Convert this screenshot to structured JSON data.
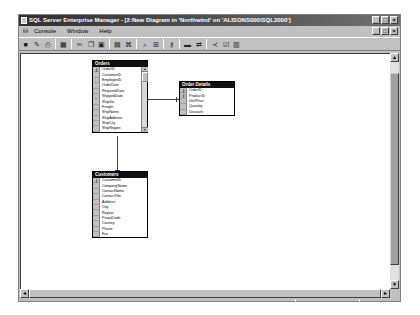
{
  "window": {
    "title": "SQL Server Enterprise Manager - [2:New Diagram in 'Northwind' on 'ALISONS000\\SQL2000']",
    "title_buttons": [
      "_",
      "□",
      "×"
    ],
    "mdi_buttons": [
      "_",
      "□",
      "×"
    ]
  },
  "menu": {
    "items": [
      {
        "label": "Console",
        "accel": "C"
      },
      {
        "label": "Window",
        "accel": "W"
      },
      {
        "label": "Help",
        "accel": "H"
      }
    ]
  },
  "toolbar": {
    "buttons": [
      {
        "name": "save-icon",
        "glyph": "■"
      },
      {
        "name": "properties-icon",
        "glyph": "✎"
      },
      {
        "name": "print-icon",
        "glyph": "⎙"
      },
      {
        "sep": true
      },
      {
        "name": "new-table-icon",
        "glyph": "▦"
      },
      {
        "sep": true
      },
      {
        "name": "cut-icon",
        "glyph": "✂"
      },
      {
        "name": "copy-icon",
        "glyph": "❐"
      },
      {
        "name": "paste-icon",
        "glyph": "▣"
      },
      {
        "sep": true
      },
      {
        "name": "add-table-icon",
        "glyph": "▤"
      },
      {
        "name": "add-related-tables-icon",
        "glyph": "⌘"
      },
      {
        "sep": true
      },
      {
        "name": "zoom-icon",
        "glyph": "⌕"
      },
      {
        "name": "arrange-tables-icon",
        "glyph": "⊞"
      },
      {
        "sep": true
      },
      {
        "name": "primary-key-icon",
        "glyph": "⚷"
      },
      {
        "sep": true
      },
      {
        "name": "table-view-icon",
        "glyph": "▬"
      },
      {
        "name": "manage-relationships-icon",
        "glyph": "⇄"
      },
      {
        "sep": true
      },
      {
        "name": "manage-indexes-icon",
        "glyph": "≺"
      },
      {
        "name": "manage-constraints-icon",
        "glyph": "☑"
      },
      {
        "name": "text-annotation-icon",
        "glyph": "▥"
      }
    ]
  },
  "diagram": {
    "tables": [
      {
        "name": "Orders",
        "key_columns": [
          0
        ],
        "columns": [
          "OrderID",
          "CustomerID",
          "EmployeeID",
          "OrderDate",
          "RequiredDate",
          "ShippedDate",
          "ShipVia",
          "Freight",
          "ShipName",
          "ShipAddress",
          "ShipCity",
          "ShipRegion"
        ],
        "has_scrollbar": true
      },
      {
        "name": "Order Details",
        "key_columns": [
          0,
          1
        ],
        "columns": [
          "OrderID",
          "ProductID",
          "UnitPrice",
          "Quantity",
          "Discount"
        ],
        "has_scrollbar": false
      },
      {
        "name": "Customers",
        "key_columns": [
          0
        ],
        "columns": [
          "CustomerID",
          "CompanyName",
          "ContactName",
          "ContactTitle",
          "Address",
          "City",
          "Region",
          "PostalCode",
          "Country",
          "Phone",
          "Fax"
        ],
        "has_scrollbar": false
      }
    ],
    "relationships": [
      {
        "from": "Order Details",
        "to": "Orders"
      },
      {
        "from": "Orders",
        "to": "Customers"
      }
    ]
  },
  "scrollbars": {
    "up": "▲",
    "down": "▼",
    "left": "◄",
    "right": "►"
  },
  "colors": {
    "chrome": "#c0c0c0",
    "title_bar": "#303030",
    "table_header": "#101010",
    "canvas": "#ffffff"
  }
}
